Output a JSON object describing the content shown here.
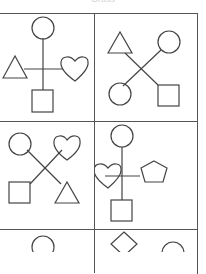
{
  "caption": "Cross",
  "grid": {
    "columns": 2,
    "rows_visible": 3,
    "cells": [
      {
        "row": 1,
        "col": 1,
        "layout": "plus",
        "top": "circle",
        "left": "triangle",
        "right": "heart",
        "bottom": "square"
      },
      {
        "row": 1,
        "col": 2,
        "layout": "x",
        "top_left": "triangle",
        "top_right": "circle",
        "bottom_left": "circle",
        "bottom_right": "square"
      },
      {
        "row": 2,
        "col": 1,
        "layout": "x",
        "top_left": "circle",
        "top_right": "heart",
        "bottom_left": "square",
        "bottom_right": "triangle"
      },
      {
        "row": 2,
        "col": 2,
        "layout": "plus",
        "top": "circle",
        "left": "heart",
        "right": "pentagon",
        "bottom": "square"
      },
      {
        "row": 3,
        "col": 1,
        "layout": "partial",
        "top": "circle"
      },
      {
        "row": 3,
        "col": 2,
        "layout": "partial",
        "top_left": "diamond",
        "top_right": "circle"
      }
    ]
  },
  "colors": {
    "line": "#444444",
    "border": "#555555",
    "background": "#ffffff"
  }
}
